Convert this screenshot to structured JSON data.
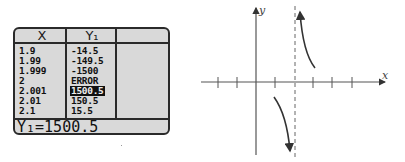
{
  "calculator": {
    "headers": [
      "X",
      "Y₁",
      ""
    ],
    "rows": [
      {
        "x": "1.9",
        "y": "-14.5"
      },
      {
        "x": "1.99",
        "y": "-149.5"
      },
      {
        "x": "1.999",
        "y": "-1500"
      },
      {
        "x": "2",
        "y": "ERROR"
      },
      {
        "x": "2.001",
        "y": "1500.5",
        "highlighted": true
      },
      {
        "x": "2.01",
        "y": "150.5"
      },
      {
        "x": "2.1",
        "y": "15.5"
      }
    ],
    "status_line": "Y₁=1500.5"
  },
  "graph": {
    "x_label": "x",
    "y_label": "y",
    "vertical_asymptote": 2,
    "tick_count_left": 2,
    "tick_count_right": 5,
    "colors": {
      "axis": "#555555",
      "curve": "#333333",
      "asymptote": "#666666"
    }
  }
}
